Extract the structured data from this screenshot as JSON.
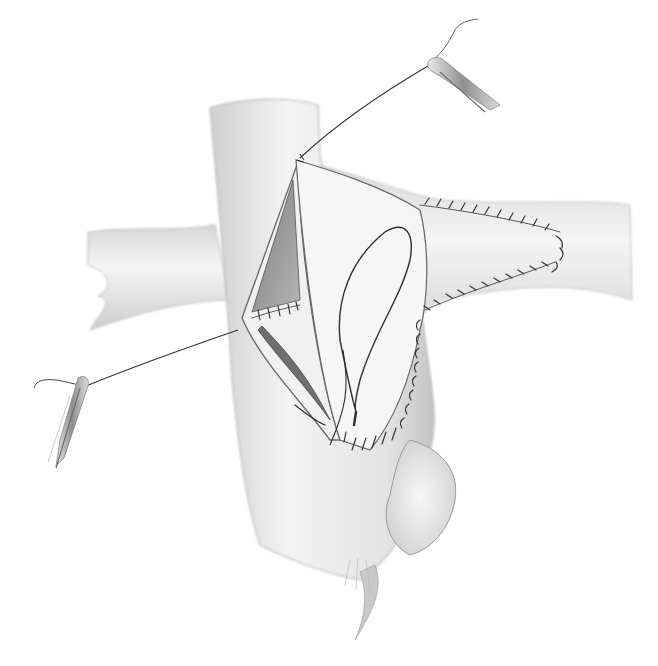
{
  "illustration": {
    "subject": "Surgical vascular anastomosis drawing (grayscale pencil rendering)",
    "parts": [
      "vertical-vessel",
      "horizontal-left-branch",
      "horizontal-right-branch",
      "open-incision-flap",
      "looped-suture",
      "running-suture-stitches",
      "suture-clamp-top-right",
      "suture-clamp-bottom-left",
      "tissue-tag-bottom"
    ]
  },
  "colors": {
    "background": "#ffffff",
    "vessel_fill": "#ececec",
    "vessel_shade": "#bdbdbd",
    "lumen_dark": "#8a8a8a",
    "outline": "#555555",
    "suture": "#333333",
    "clamp": "#9a9a9a"
  }
}
